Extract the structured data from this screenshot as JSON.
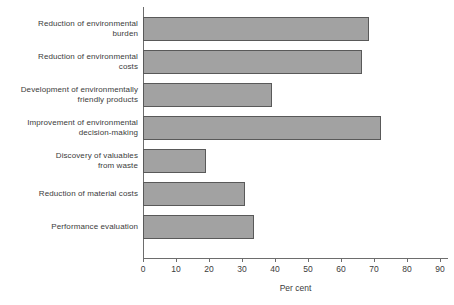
{
  "chart_data": {
    "type": "bar",
    "orientation": "horizontal",
    "title": "",
    "xlabel": "Per cent",
    "ylabel": "",
    "xlim": [
      0,
      95
    ],
    "grid": false,
    "legend": null,
    "categories": [
      "Reduction of environmental burden",
      "Reduction of environmental costs",
      "Development of environmentally friendly products",
      "Improvement of environmental decision-making",
      "Discovery of valuables from waste",
      "Reduction of material costs",
      "Performance evaluation"
    ],
    "category_lines": [
      [
        "Reduction of environmental",
        "burden"
      ],
      [
        "Reduction of environmental",
        "costs"
      ],
      [
        "Development of environmentally",
        "friendly products"
      ],
      [
        "Improvement of environmental",
        "decision-making"
      ],
      [
        "Discovery of valuables",
        "from waste"
      ],
      [
        "Reduction of material costs"
      ],
      [
        "Performance evaluation"
      ]
    ],
    "values": [
      68.5,
      66.5,
      39,
      72,
      19,
      31,
      33.5
    ],
    "xticks": [
      0,
      10,
      20,
      30,
      40,
      50,
      60,
      70,
      80,
      90
    ],
    "xtick_labels": [
      "0",
      "10",
      "20",
      "30",
      "40",
      "50",
      "60",
      "70",
      "80",
      "90"
    ],
    "colors": {
      "bar_fill": "#a2a2a2",
      "bar_border": "#595959",
      "axis": "#6d6d6d",
      "text": "#3b3b3b",
      "background": "#ffffff"
    }
  }
}
